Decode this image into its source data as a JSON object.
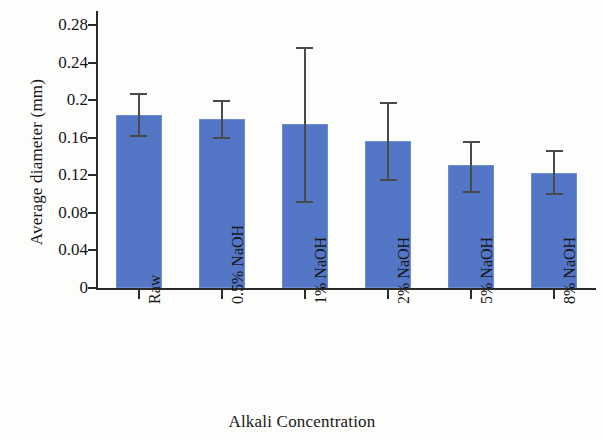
{
  "chart_data": {
    "type": "bar",
    "title": "",
    "xlabel": "Alkali Concentration",
    "ylabel": "Average diameter (mm)",
    "categories": [
      "Raw",
      "0.5% NaOH",
      "1% NaOH",
      "2% NaOH",
      "5% NaOH",
      "8% NaOH"
    ],
    "values": [
      0.184,
      0.18,
      0.175,
      0.157,
      0.131,
      0.122
    ],
    "error_upper": [
      0.207,
      0.199,
      0.255,
      0.197,
      0.155,
      0.146
    ],
    "error_lower": [
      0.162,
      0.16,
      0.092,
      0.115,
      0.102,
      0.1
    ],
    "ylim": [
      0,
      0.3
    ],
    "yticks": [
      0,
      0.04,
      0.08,
      0.12,
      0.16,
      0.2,
      0.24,
      0.28
    ],
    "ytick_labels": [
      "0",
      "0.04",
      "0.08",
      "0.12",
      "0.16",
      "0.2",
      "0.24",
      "0.28"
    ],
    "grid": false,
    "legend": "none",
    "bar_color": "#5377c6",
    "error_color": "#4a4a4a",
    "axis_color": "#2b2b2b"
  }
}
